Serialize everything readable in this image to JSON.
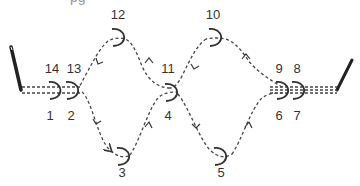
{
  "diagram": {
    "type": "sewing path / crochet hook stitch diagram",
    "clipped_caption": "pg",
    "colors": {
      "line": "#333333",
      "needle": "#222222",
      "background": "#ffffff"
    },
    "nodes": [
      {
        "id": "1",
        "label": "1",
        "x": 50,
        "y": 115
      },
      {
        "id": "2",
        "label": "2",
        "x": 71,
        "y": 115
      },
      {
        "id": "3",
        "label": "3",
        "x": 122,
        "y": 172
      },
      {
        "id": "4",
        "label": "4",
        "x": 168,
        "y": 115
      },
      {
        "id": "5",
        "label": "5",
        "x": 221,
        "y": 172
      },
      {
        "id": "6",
        "label": "6",
        "x": 279,
        "y": 115
      },
      {
        "id": "7",
        "label": "7",
        "x": 297,
        "y": 115
      },
      {
        "id": "8",
        "label": "8",
        "x": 297,
        "y": 68
      },
      {
        "id": "9",
        "label": "9",
        "x": 279,
        "y": 68
      },
      {
        "id": "10",
        "label": "10",
        "x": 213,
        "y": 14
      },
      {
        "id": "11",
        "label": "11",
        "x": 168,
        "y": 68
      },
      {
        "id": "12",
        "label": "12",
        "x": 118,
        "y": 14
      },
      {
        "id": "13",
        "label": "13",
        "x": 74,
        "y": 68
      },
      {
        "id": "14",
        "label": "14",
        "x": 52,
        "y": 68
      }
    ],
    "sequence": [
      "1",
      "2",
      "3",
      "4",
      "5",
      "6",
      "7",
      "8",
      "9",
      "10",
      "11",
      "12",
      "13",
      "14"
    ]
  }
}
